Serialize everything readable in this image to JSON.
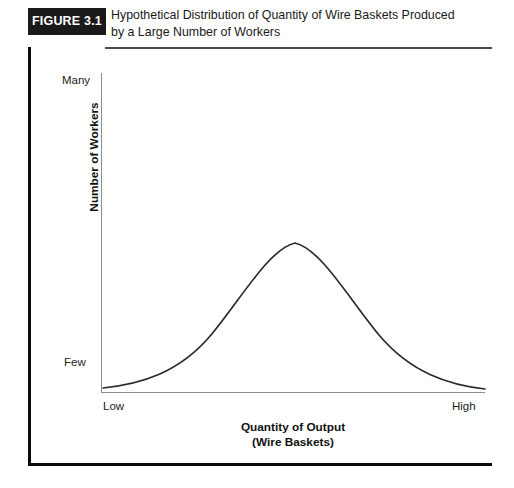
{
  "figure": {
    "badge_label": "FIGURE 3.1",
    "title_line1": "Hypothetical Distribution of Quantity of Wire Baskets Produced",
    "title_line2": "by a Large Number of Workers"
  },
  "axes": {
    "y_axis_title": "Number of Workers",
    "y_tick_top": "Many",
    "y_tick_bottom": "Few",
    "x_axis_title_line1": "Quantity of Output",
    "x_axis_title_line2": "(Wire Baskets)",
    "x_tick_left": "Low",
    "x_tick_right": "High"
  },
  "colors": {
    "badge_background": "#1a1a1a",
    "badge_text": "#ffffff",
    "frame": "#0b0b0b",
    "title_rule": "#4a4a4a",
    "axis_line": "#8d8d8d",
    "curve": "#2b2b2b",
    "page_background": "#ffffff"
  },
  "chart_data": {
    "type": "line",
    "title": "Hypothetical Distribution of Quantity of Wire Baskets Produced by a Large Number of Workers",
    "subtitle": "",
    "xlabel": "Quantity of Output (Wire Baskets)",
    "ylabel": "Number of Workers",
    "grid": false,
    "legend": "none",
    "xlim": [
      0,
      100
    ],
    "ylim": [
      0,
      100
    ],
    "x_tick_labels": [
      "Low",
      "High"
    ],
    "y_tick_labels": [
      "Few",
      "Many"
    ],
    "annotations": [],
    "series": [
      {
        "name": "Normal distribution of worker output",
        "x": [
          0,
          5,
          10,
          15,
          20,
          25,
          30,
          35,
          40,
          45,
          50,
          55,
          60,
          65,
          70,
          75,
          80,
          85,
          90,
          95,
          100
        ],
        "y": [
          1.5,
          2.5,
          4.0,
          6.5,
          10.5,
          17.0,
          26.0,
          38.0,
          52.0,
          65.0,
          74.0,
          77.0,
          74.0,
          65.5,
          53.0,
          40.0,
          28.0,
          18.5,
          11.5,
          6.5,
          3.5
        ]
      }
    ],
    "curve_geometry": {
      "baseline_y_px": 315,
      "peak_x_px": 194,
      "peak_y_px": 170,
      "path": "M 2,315 C 40,311 78,300 110,262 C 140,226 168,176 194,170 C 220,176 248,226 278,262 C 310,300 348,312 384,316"
    }
  }
}
